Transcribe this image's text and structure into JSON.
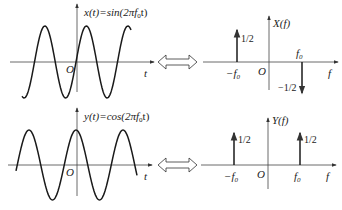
{
  "top": {
    "time_label": "x(t)=sin(2πf",
    "time_sub": "0",
    "time_tail": "t)",
    "time_axis": "t",
    "origin": "O",
    "freq_label": "X(f)",
    "freq_axis": "f",
    "neg_f0": "−f",
    "pos_f0": "f",
    "f0_sub": "0",
    "neg_amp": "1/2",
    "pos_amp": "−1/2"
  },
  "bottom": {
    "time_label": "y(t)=cos(2πf",
    "time_sub": "0",
    "time_tail": "t)",
    "time_axis": "t",
    "origin": "O",
    "freq_label": "Y(f)",
    "freq_axis": "f",
    "neg_f0": "−f",
    "pos_f0": "f",
    "f0_sub": "0",
    "neg_amp": "1/2",
    "pos_amp": "1/2"
  },
  "colors": {
    "line": "#1a1a1a",
    "axis": "#444444"
  }
}
